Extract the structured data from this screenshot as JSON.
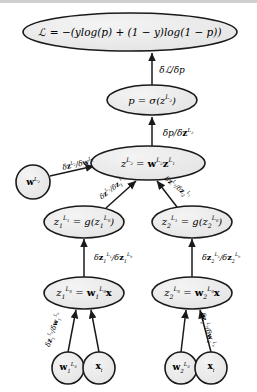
{
  "diagram": {
    "background_color": "#ffffff",
    "node_fill": "#ececec",
    "node_stroke": "#1a1a1a",
    "edge_color": "#1a1a1a",
    "nodes": [
      {
        "id": "loss",
        "shape": "ellipse",
        "cx": 130,
        "cy": 32,
        "rx": 107,
        "ry": 19,
        "font_size": 10.5,
        "label_html": "ℒ = −(<i>ylog</i>(<i>p</i>) + (1 − <i>y</i>)<i>log</i>(1 − <i>p</i>))"
      },
      {
        "id": "p_sigmoid",
        "shape": "ellipse",
        "cx": 152,
        "cy": 100,
        "rx": 45,
        "ry": 15,
        "font_size": 10,
        "label_html": "<i>p</i> = σ(<i>z</i><span class=\"sup\">L<span class=\"sub\">2</span></span>)"
      },
      {
        "id": "z_L2",
        "shape": "ellipse",
        "cx": 148,
        "cy": 163,
        "rx": 57,
        "ry": 17,
        "font_size": 10,
        "label_html": "<i>z</i><span class=\"sup\">L<span class=\"sub\">2</span></span> = <span class=\"mbf\">w</span><span class=\"sup\">L<span class=\"sub\">2</span></span><span class=\"mbf\">z</span><span class=\"sup\">L<span class=\"sub\">1</span></span>"
      },
      {
        "id": "w_L2",
        "shape": "circle",
        "cx": 33,
        "cy": 182,
        "rx": 17,
        "ry": 17,
        "font_size": 9,
        "label_html": "<span class=\"mbf\">w</span><span class=\"sup\">L<span class=\"sub\">2</span></span>"
      },
      {
        "id": "z1_L1",
        "shape": "ellipse",
        "cx": 84,
        "cy": 222,
        "rx": 40,
        "ry": 16,
        "font_size": 10,
        "label_html": "<i>z</i><span class=\"sub\">1</span><span class=\"sup\">L<span class=\"sub\">1</span></span> = <i>g</i>(<i>z</i><span class=\"sub\">1</span><span class=\"sup\">L<span class=\"sub\">0</span></span>)"
      },
      {
        "id": "z2_L1",
        "shape": "ellipse",
        "cx": 192,
        "cy": 222,
        "rx": 40,
        "ry": 16,
        "font_size": 10,
        "label_html": "<i>z</i><span class=\"sub\">2</span><span class=\"sup\">L<span class=\"sub\">1</span></span> = <i>g</i>(<i>z</i><span class=\"sub\">2</span><span class=\"sup\">L<span class=\"sub\">0</span></span>)"
      },
      {
        "id": "z1_L0",
        "shape": "ellipse",
        "cx": 84,
        "cy": 293,
        "rx": 40,
        "ry": 16,
        "font_size": 10,
        "label_html": "<i>z</i><span class=\"sub\">1</span><span class=\"sup\">L<span class=\"sub\">0</span></span> = <span class=\"mbf\">w</span><span class=\"sub\">1</span><span class=\"sup\">L<span class=\"sub\">0</span></span><span class=\"mbf\">x</span>"
      },
      {
        "id": "z2_L0",
        "shape": "ellipse",
        "cx": 192,
        "cy": 293,
        "rx": 40,
        "ry": 16,
        "font_size": 10,
        "label_html": "<i>z</i><span class=\"sub\">2</span><span class=\"sup\">L<span class=\"sub\">0</span></span> = <span class=\"mbf\">w</span><span class=\"sub\">2</span><span class=\"sup\">L<span class=\"sub\">0</span></span><span class=\"mbf\">x</span>"
      },
      {
        "id": "w1_L0",
        "shape": "circle",
        "cx": 68,
        "cy": 368,
        "rx": 16,
        "ry": 16,
        "font_size": 9,
        "label_html": "<span class=\"mbf\">w</span><span class=\"sub\">1</span><span class=\"sup\">L<span class=\"sub\">0</span></span>"
      },
      {
        "id": "x_i_left",
        "shape": "circle",
        "cx": 99,
        "cy": 368,
        "rx": 16,
        "ry": 16,
        "font_size": 9,
        "label_html": "<span class=\"mbf\">x</span><span class=\"sub\">i</span>"
      },
      {
        "id": "w2_L0",
        "shape": "circle",
        "cx": 181,
        "cy": 368,
        "rx": 16,
        "ry": 16,
        "font_size": 9,
        "label_html": "<span class=\"mbf\">w</span><span class=\"sub\">2</span><span class=\"sup\">L<span class=\"sub\">0</span></span>"
      },
      {
        "id": "x_i_right",
        "shape": "circle",
        "cx": 211,
        "cy": 368,
        "rx": 16,
        "ry": 16,
        "font_size": 9,
        "label_html": "<span class=\"mbf\">x</span><span class=\"sub\">i</span>"
      }
    ],
    "edges": [
      {
        "id": "e-p-to-loss",
        "from": "p_sigmoid",
        "to": "loss",
        "x1": 152,
        "y1": 85,
        "x2": 152,
        "y2": 53
      },
      {
        "id": "e-zL2-to-p",
        "from": "z_L2",
        "to": "p_sigmoid",
        "x1": 152,
        "y1": 146,
        "x2": 152,
        "y2": 117
      },
      {
        "id": "e-wL2-to-zL2",
        "from": "w_L2",
        "to": "z_L2",
        "x1": 50,
        "y1": 176,
        "x2": 94,
        "y2": 166
      },
      {
        "id": "e-z1L1-to-zL2",
        "from": "z1_L1",
        "to": "z_L2",
        "x1": 106,
        "y1": 208,
        "x2": 136,
        "y2": 181
      },
      {
        "id": "e-z2L1-to-zL2",
        "from": "z2_L1",
        "to": "z_L2",
        "x1": 177,
        "y1": 207,
        "x2": 157,
        "y2": 181
      },
      {
        "id": "e-z1L0-to-z1L1",
        "from": "z1_L0",
        "to": "z1_L1",
        "x1": 84,
        "y1": 277,
        "x2": 84,
        "y2": 239
      },
      {
        "id": "e-z2L0-to-z2L1",
        "from": "z2_L0",
        "to": "z2_L1",
        "x1": 192,
        "y1": 277,
        "x2": 192,
        "y2": 239
      },
      {
        "id": "e-w1L0-to-z1L0",
        "from": "w1_L0",
        "to": "z1_L0",
        "x1": 68,
        "y1": 352,
        "x2": 76,
        "y2": 310
      },
      {
        "id": "e-xil-to-z1L0",
        "from": "x_i_left",
        "to": "z1_L0",
        "x1": 99,
        "y1": 352,
        "x2": 91,
        "y2": 310
      },
      {
        "id": "e-w2L0-to-z2L0",
        "from": "w2_L0",
        "to": "z2_L0",
        "x1": 181,
        "y1": 352,
        "x2": 186,
        "y2": 310
      },
      {
        "id": "e-xir-to-z2L0",
        "from": "x_i_right",
        "to": "z2_L0",
        "x1": 211,
        "y1": 352,
        "x2": 200,
        "y2": 310
      }
    ],
    "edge_labels": [
      {
        "id": "lbl-dL-dp",
        "x": 172,
        "y": 70,
        "font_size": 9,
        "rotation_class": "",
        "label_html": "δℒ/δ<i>p</i>"
      },
      {
        "id": "lbl-dp-dzL2",
        "x": 178,
        "y": 133,
        "font_size": 9,
        "rotation_class": "",
        "label_html": "δ<i>p</i>/δ<span class=\"mbf\">z</span><span class=\"sup\">L<span class=\"sub\">2</span></span>"
      },
      {
        "id": "lbl-dzL2-dwL2",
        "x": 78,
        "y": 164,
        "font_size": 7.5,
        "rotation_class": "tilt-wl2",
        "label_html": "δ<span class=\"mbf\">z</span><span class=\"sup\">L<span class=\"sub\">2</span></span>/δ<span class=\"mbf\">w</span><span class=\"sup\">L<span class=\"sub\">2</span></span>"
      },
      {
        "id": "lbl-dzL2-dz1L1",
        "x": 113,
        "y": 189,
        "font_size": 7,
        "rotation_class": "diag-left",
        "label_html": "δ<span class=\"mbf\">z</span><span class=\"sup\">L<span class=\"sub\">2</span></span>/δ<span class=\"mbf\">z</span><span class=\"sub\">1</span><span class=\"sup\">L<span class=\"sub\">1</span></span>"
      },
      {
        "id": "lbl-dzL2-dz2L1",
        "x": 177,
        "y": 188,
        "font_size": 7,
        "rotation_class": "diag-right",
        "label_html": "δ<span class=\"mbf\">z</span><span class=\"sup\">L<span class=\"sub\">2</span></span>/δ<span class=\"mbf\">z</span><span class=\"sub\">2</span><span class=\"sup\">L<span class=\"sub\">1</span></span>"
      },
      {
        "id": "lbl-dz1L1-dz1L0",
        "x": 113,
        "y": 258,
        "font_size": 8,
        "rotation_class": "",
        "label_html": "δ<span class=\"mbf\">z</span><span class=\"sub\">1</span><span class=\"sup\">L<span class=\"sub\">1</span></span>/δ<span class=\"mbf\">z</span><span class=\"sub\">1</span><span class=\"sup\">L<span class=\"sub\">0</span></span>"
      },
      {
        "id": "lbl-dz2L1-dz2L0",
        "x": 221,
        "y": 258,
        "font_size": 8,
        "rotation_class": "",
        "label_html": "δ<span class=\"mbf\">z</span><span class=\"sub\">2</span><span class=\"sup\">L<span class=\"sub\">1</span></span>/δ<span class=\"mbf\">z</span><span class=\"sub\">2</span><span class=\"sup\">L<span class=\"sub\">0</span></span>"
      },
      {
        "id": "lbl-dz1L0-dw1L0",
        "x": 54,
        "y": 330,
        "font_size": 7,
        "rotation_class": "rot-left",
        "label_html": "δ<span class=\"mbf\">z</span><span class=\"sub\">1</span><span class=\"sup\">L<span class=\"sub\">0</span></span>/δ<span class=\"mbf\">w</span><span class=\"sub\">1</span><span class=\"sup\">L<span class=\"sub\">0</span></span>"
      },
      {
        "id": "lbl-dz2L0-dw2L0",
        "x": 207,
        "y": 330,
        "font_size": 7,
        "rotation_class": "rot-right",
        "label_html": "δ<span class=\"mbf\">z</span><span class=\"sub\">2</span><span class=\"sup\">L<span class=\"sub\">0</span></span>/δ<span class=\"mbf\">w</span><span class=\"sub\">2</span><span class=\"sup\">L<span class=\"sub\">0</span></span>"
      }
    ]
  }
}
